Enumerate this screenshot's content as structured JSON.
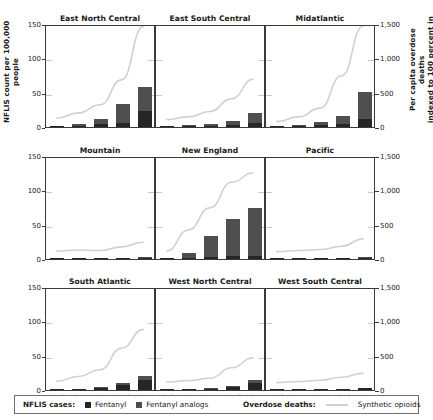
{
  "axes": {
    "ylabel_left": "NFLIS count per 100,000\npeople",
    "ylabel_right": "Per capita overdose deaths\nindexed to 100 percent in\n2013",
    "left_ticks": [
      "0",
      "50",
      "100",
      "150"
    ],
    "right_ticks": [
      "0",
      "500",
      "1,000",
      "1,500"
    ],
    "x_ticks": [
      "2013",
      "2014",
      "2015",
      "2016",
      "2017"
    ]
  },
  "legend": {
    "nflis_label": "NFLIS cases:",
    "fentanyl": "Fentanyl",
    "analogs": "Fentanyl analogs",
    "deaths_label": "Overdose deaths:",
    "synthetic": "Synthetic opioids",
    "color_fentanyl": "#262626",
    "color_analogs": "#4f4f4f",
    "color_line": "#d0d0d0"
  },
  "chart_data": {
    "type": "bar",
    "title": "",
    "xlabel": "",
    "ylabel": "NFLIS count per 100,000 people",
    "ylabel2": "Per capita overdose deaths indexed to 100 percent in 2013",
    "x": [
      "2013",
      "2014",
      "2015",
      "2016",
      "2017"
    ],
    "ylim": [
      0,
      150
    ],
    "ylim2": [
      0,
      1500
    ],
    "grid": "faint-horizontal",
    "legend_position": "bottom",
    "panels": [
      {
        "title": "East North Central",
        "series": [
          {
            "name": "Fentanyl",
            "values": [
              0.5,
              1.5,
              4.0,
              6.0,
              23.0
            ]
          },
          {
            "name": "Fentanyl analogs",
            "values": [
              0.3,
              2.5,
              8.0,
              28.0,
              35.0
            ]
          }
        ],
        "line": {
          "name": "Synthetic opioids",
          "values": [
            130,
            210,
            330,
            700,
            1490
          ]
        }
      },
      {
        "title": "East South Central",
        "series": [
          {
            "name": "Fentanyl",
            "values": [
              0.2,
              0.8,
              1.5,
              2.5,
              6.0
            ]
          },
          {
            "name": "Fentanyl analogs",
            "values": [
              0.2,
              1.5,
              3.5,
              6.5,
              15.0
            ]
          }
        ],
        "line": {
          "name": "Synthetic opioids",
          "values": [
            110,
            150,
            230,
            420,
            710
          ]
        }
      },
      {
        "title": "Midatlantic",
        "series": [
          {
            "name": "Fentanyl",
            "values": [
              0.3,
              1.0,
              2.5,
              4.0,
              12.0
            ]
          },
          {
            "name": "Fentanyl analogs",
            "values": [
              0.2,
              1.5,
              4.5,
              12.0,
              39.0
            ]
          }
        ],
        "line": {
          "name": "Synthetic opioids",
          "values": [
            80,
            150,
            280,
            760,
            1500
          ]
        }
      },
      {
        "title": "Mountain",
        "series": [
          {
            "name": "Fentanyl",
            "values": [
              0.1,
              0.2,
              0.4,
              0.8,
              2.0
            ]
          },
          {
            "name": "Fentanyl analogs",
            "values": [
              0.0,
              0.1,
              0.2,
              0.4,
              0.6
            ]
          }
        ],
        "line": {
          "name": "Synthetic opioids",
          "values": [
            115,
            135,
            125,
            180,
            250
          ]
        }
      },
      {
        "title": "New England",
        "series": [
          {
            "name": "Fentanyl",
            "values": [
              0.5,
              1.5,
              3.0,
              5.0,
              5.0
            ]
          },
          {
            "name": "Fentanyl analogs",
            "values": [
              0.3,
              7.0,
              30.0,
              53.0,
              69.0
            ]
          }
        ],
        "line": {
          "name": "Synthetic opioids",
          "values": [
            120,
            430,
            760,
            1140,
            1280
          ]
        }
      },
      {
        "title": "Pacific",
        "series": [
          {
            "name": "Fentanyl",
            "values": [
              0.1,
              0.2,
              0.5,
              1.0,
              2.2
            ]
          },
          {
            "name": "Fentanyl analogs",
            "values": [
              0.0,
              0.1,
              0.2,
              0.4,
              0.8
            ]
          }
        ],
        "line": {
          "name": "Synthetic opioids",
          "values": [
            110,
            125,
            140,
            190,
            300
          ]
        }
      },
      {
        "title": "South Atlantic",
        "series": [
          {
            "name": "Fentanyl",
            "values": [
              0.3,
              1.0,
              3.0,
              7.0,
              14.0
            ]
          },
          {
            "name": "Fentanyl analogs",
            "values": [
              0.2,
              0.5,
              1.5,
              3.0,
              6.0
            ]
          }
        ],
        "line": {
          "name": "Synthetic opioids",
          "values": [
            130,
            200,
            300,
            620,
            900
          ]
        }
      },
      {
        "title": "West North Central",
        "series": [
          {
            "name": "Fentanyl",
            "values": [
              0.2,
              0.6,
              1.8,
              4.0,
              10.0
            ]
          },
          {
            "name": "Fentanyl analogs",
            "values": [
              0.1,
              0.3,
              0.9,
              2.0,
              4.5
            ]
          }
        ],
        "line": {
          "name": "Synthetic opioids",
          "values": [
            120,
            140,
            175,
            330,
            480
          ]
        }
      },
      {
        "title": "West South Central",
        "series": [
          {
            "name": "Fentanyl",
            "values": [
              0.1,
              0.2,
              0.5,
              1.2,
              2.3
            ]
          },
          {
            "name": "Fentanyl analogs",
            "values": [
              0.0,
              0.1,
              0.1,
              0.3,
              0.6
            ]
          }
        ],
        "line": {
          "name": "Synthetic opioids",
          "values": [
            110,
            125,
            145,
            190,
            250
          ]
        }
      }
    ]
  }
}
